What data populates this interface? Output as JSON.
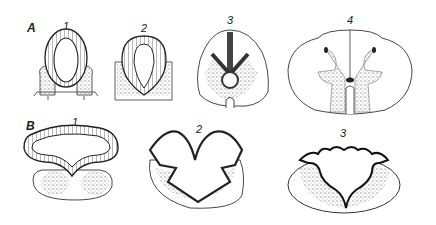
{
  "figure": {
    "rows": [
      {
        "label": "А",
        "panels": [
          {
            "number": "1",
            "description": "early neural tube cross-section, oval lumen with columnar epithelium"
          },
          {
            "number": "2",
            "description": "neural tube with thickened walls and mantle layer"
          },
          {
            "number": "3",
            "description": "developing spinal cord with central canal and emerging horns"
          },
          {
            "number": "4",
            "description": "mature spinal cord cross-section with butterfly-shaped gray matter"
          }
        ]
      },
      {
        "label": "В",
        "panels": [
          {
            "number": "1",
            "description": "wide flattened neural tube with thin roof"
          },
          {
            "number": "2",
            "description": "folded neural plate/tube with W-shaped lumen"
          },
          {
            "number": "3",
            "description": "highly folded neural tube with star-shaped lumen"
          }
        ]
      }
    ],
    "colors": {
      "line": "#222222",
      "stipple": "#9a9a9a",
      "background": "#ffffff"
    }
  }
}
